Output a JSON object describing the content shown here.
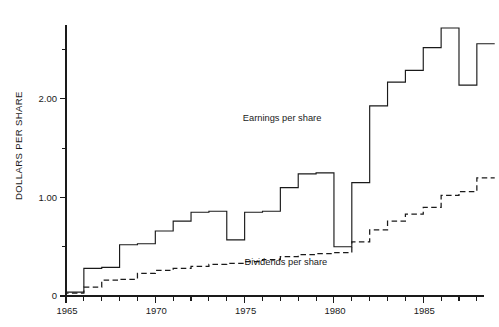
{
  "chart_data": {
    "type": "line",
    "subtype": "step",
    "title": "",
    "xlabel": "",
    "ylabel": "DOLLARS PER SHARE",
    "xlim": [
      1965,
      1988.4
    ],
    "ylim": [
      0,
      2.75
    ],
    "grid": false,
    "legend_position": "inline-annotations",
    "x_ticks_major": [
      1965,
      1970,
      1975,
      1980,
      1985
    ],
    "x_tick_labels": [
      "1965",
      "1970",
      "1975",
      "1980",
      "1985"
    ],
    "x_ticks_minor": [
      1966,
      1967,
      1968,
      1969,
      1971,
      1972,
      1973,
      1974,
      1976,
      1977,
      1978,
      1979,
      1981,
      1982,
      1983,
      1984,
      1986,
      1987,
      1988
    ],
    "y_ticks_major": [
      0,
      1.0,
      2.0
    ],
    "y_tick_labels": [
      "0",
      "1.00",
      "2.00"
    ],
    "y_ticks_minor": [
      0.5,
      1.5,
      2.5
    ],
    "x": [
      1965,
      1966,
      1967,
      1968,
      1969,
      1970,
      1971,
      1972,
      1973,
      1974,
      1975,
      1976,
      1977,
      1978,
      1979,
      1980,
      1981,
      1982,
      1983,
      1984,
      1985,
      1986,
      1987,
      1988
    ],
    "series": [
      {
        "name": "Earnings per share",
        "style": "solid",
        "label": "Earnings per share",
        "label_x": 1974.9,
        "label_y": 1.78,
        "values": [
          0.04,
          0.28,
          0.29,
          0.52,
          0.53,
          0.66,
          0.76,
          0.85,
          0.86,
          0.57,
          0.85,
          0.86,
          1.1,
          1.24,
          1.25,
          0.5,
          1.15,
          1.93,
          2.17,
          2.29,
          2.52,
          2.72,
          2.14,
          2.56
        ]
      },
      {
        "name": "Dividends per share",
        "style": "dashed",
        "label": "Dividends per share",
        "label_x": 1975.0,
        "label_y": 0.32,
        "values": [
          0.03,
          0.09,
          0.16,
          0.17,
          0.23,
          0.26,
          0.28,
          0.3,
          0.32,
          0.33,
          0.35,
          0.37,
          0.4,
          0.42,
          0.43,
          0.44,
          0.55,
          0.67,
          0.76,
          0.83,
          0.9,
          1.02,
          1.06,
          1.2
        ]
      }
    ]
  }
}
